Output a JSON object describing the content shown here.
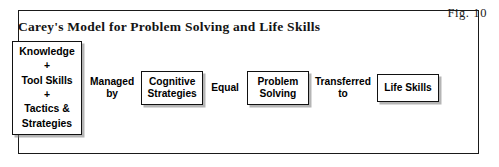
{
  "figure": {
    "number_label": "Fig. 10",
    "title": "Carey's Model for Problem Solving and Life Skills"
  },
  "diagram": {
    "type": "linear-flow",
    "nodes": [
      {
        "id": "inputs",
        "label": "Knowledge\n+\nTool Skills\n+\nTactics &\nStrategies"
      },
      {
        "id": "cognitive-strategies",
        "label": "Cognitive\nStrategies"
      },
      {
        "id": "problem-solving",
        "label": "Problem\nSolving"
      },
      {
        "id": "life-skills",
        "label": "Life Skills"
      }
    ],
    "connectors": [
      {
        "id": "managed-by",
        "label": "Managed\nby"
      },
      {
        "id": "equal",
        "label": "Equal"
      },
      {
        "id": "transferred-to",
        "label": "Transferred\nto"
      }
    ]
  },
  "colors": {
    "frame": "#1a1a1a",
    "node_border": "#111111",
    "text": "#000000",
    "background": "#ffffff",
    "shadow": "rgba(120,120,120,0.55)"
  }
}
